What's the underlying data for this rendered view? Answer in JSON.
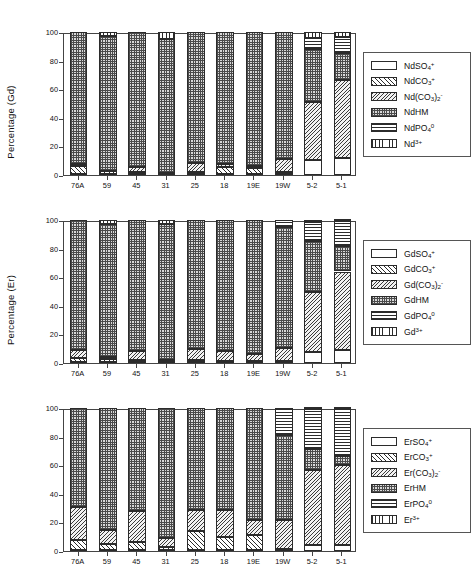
{
  "figure": {
    "panels": [
      {
        "id": "nd",
        "ylabel": "Percentage (Nd)",
        "legend_title": "Nd species",
        "legend": [
          {
            "key": "SO4",
            "label_html": "NdSO<sub>4</sub><sup>+</sup>",
            "pattern": "p-so4"
          },
          {
            "key": "CO3",
            "label_html": "NdCO<sub>3</sub><sup>+</sup>",
            "pattern": "p-co3"
          },
          {
            "key": "CO32",
            "label_html": "Nd(CO<sub>3</sub>)<sub>2</sub><sup>-</sup>",
            "pattern": "p-co32"
          },
          {
            "key": "HM",
            "label_html": "NdHM",
            "pattern": "p-hm"
          },
          {
            "key": "PO4",
            "label_html": "NdPO<sub>4</sub><sup>0</sup>",
            "pattern": "p-po4"
          },
          {
            "key": "FREE",
            "label_html": "Nd<sup>3+</sup>",
            "pattern": "p-free"
          }
        ]
      },
      {
        "id": "gd",
        "ylabel": "Percentage (Gd)",
        "legend_title": "Gd species",
        "legend": [
          {
            "key": "SO4",
            "label_html": "GdSO<sub>4</sub><sup>+</sup>",
            "pattern": "p-so4"
          },
          {
            "key": "CO3",
            "label_html": "GdCO<sub>3</sub><sup>+</sup>",
            "pattern": "p-co3"
          },
          {
            "key": "CO32",
            "label_html": "Gd(CO<sub>3</sub>)<sub>2</sub><sup>-</sup>",
            "pattern": "p-co32"
          },
          {
            "key": "HM",
            "label_html": "GdHM",
            "pattern": "p-hm"
          },
          {
            "key": "PO4",
            "label_html": "GdPO<sub>4</sub><sup>0</sup>",
            "pattern": "p-po4"
          },
          {
            "key": "FREE",
            "label_html": "Gd<sup>3+</sup>",
            "pattern": "p-free"
          }
        ]
      },
      {
        "id": "er",
        "ylabel": "Percentage (Er)",
        "legend_title": "Er species",
        "legend": [
          {
            "key": "SO4",
            "label_html": "ErSO<sub>4</sub><sup>+</sup>",
            "pattern": "p-so4"
          },
          {
            "key": "CO3",
            "label_html": "ErCO<sub>3</sub><sup>+</sup>",
            "pattern": "p-co3"
          },
          {
            "key": "CO32",
            "label_html": "Er(CO<sub>3</sub>)<sub>2</sub><sup>-</sup>",
            "pattern": "p-co32"
          },
          {
            "key": "HM",
            "label_html": "ErHM",
            "pattern": "p-hm"
          },
          {
            "key": "PO4",
            "label_html": "ErPO<sub>4</sub><sup>0</sup>",
            "pattern": "p-po4"
          },
          {
            "key": "FREE",
            "label_html": "Er<sup>3+</sup>",
            "pattern": "p-free"
          }
        ]
      }
    ]
  },
  "chart_data": [
    {
      "type": "bar",
      "stacked": true,
      "title": "",
      "xlabel": "",
      "ylabel": "Percentage (Nd)",
      "ylim": [
        0,
        100
      ],
      "yticks": [
        0,
        20,
        40,
        60,
        80,
        100
      ],
      "grid": false,
      "legend_position": "right-outside",
      "categories": [
        "76A",
        "59",
        "45",
        "31",
        "25",
        "18",
        "19E",
        "19W",
        "5-2",
        "5-1"
      ],
      "series": [
        {
          "name": "NdSO4+",
          "pattern": "p-so4",
          "values": [
            0.6,
            0.5,
            0.5,
            0.4,
            0.6,
            0.5,
            0.5,
            0.8,
            10.3,
            12.0
          ]
        },
        {
          "name": "NdCO3+",
          "pattern": "p-co3",
          "values": [
            5.6,
            2.3,
            1.9,
            0.8,
            1.7,
            5.0,
            4.6,
            1.0,
            0.0,
            0.0
          ]
        },
        {
          "name": "Nd(CO3)2-",
          "pattern": "p-co32",
          "values": [
            1.3,
            0.0,
            3.4,
            0.0,
            5.8,
            2.2,
            1.5,
            9.2,
            41.0,
            54.5
          ]
        },
        {
          "name": "NdHM",
          "pattern": "p-hm",
          "values": [
            92.5,
            94.2,
            94.2,
            94.0,
            91.9,
            92.3,
            93.4,
            89.0,
            37.0,
            19.0
          ]
        },
        {
          "name": "NdPO4-0",
          "pattern": "p-po4",
          "values": [
            0.0,
            0.0,
            0.0,
            0.0,
            0.0,
            0.0,
            0.0,
            0.0,
            7.2,
            11.0
          ]
        },
        {
          "name": "Nd3+",
          "pattern": "p-free",
          "values": [
            0.0,
            3.0,
            0.0,
            4.8,
            0.0,
            0.0,
            0.0,
            0.0,
            4.5,
            3.5
          ]
        }
      ]
    },
    {
      "type": "bar",
      "stacked": true,
      "title": "",
      "xlabel": "",
      "ylabel": "Percentage (Gd)",
      "ylim": [
        0,
        100
      ],
      "yticks": [
        0,
        20,
        40,
        60,
        80,
        100
      ],
      "grid": false,
      "legend_position": "right-outside",
      "categories": [
        "76A",
        "59",
        "45",
        "31",
        "25",
        "18",
        "19E",
        "19W",
        "5-2",
        "5-1"
      ],
      "series": [
        {
          "name": "GdSO4+",
          "pattern": "p-so4",
          "values": [
            0.5,
            0.5,
            0.4,
            0.4,
            0.5,
            0.4,
            0.4,
            0.6,
            8.0,
            9.0
          ]
        },
        {
          "name": "GdCO3+",
          "pattern": "p-co3",
          "values": [
            3.0,
            2.2,
            2.0,
            1.0,
            1.5,
            1.2,
            1.0,
            1.0,
            0.0,
            0.0
          ]
        },
        {
          "name": "Gd(CO3)2-",
          "pattern": "p-co32",
          "values": [
            5.5,
            1.8,
            6.0,
            1.0,
            7.5,
            7.0,
            4.8,
            9.0,
            41.5,
            55.0
          ]
        },
        {
          "name": "GdHM",
          "pattern": "p-hm",
          "values": [
            91.0,
            93.0,
            91.6,
            94.6,
            90.5,
            91.4,
            93.8,
            84.4,
            36.0,
            17.5
          ]
        },
        {
          "name": "GdPO4-0",
          "pattern": "p-po4",
          "values": [
            0.0,
            0.0,
            0.0,
            0.0,
            0.0,
            0.0,
            0.0,
            5.0,
            13.0,
            17.5
          ]
        },
        {
          "name": "Gd3+",
          "pattern": "p-free",
          "values": [
            0.0,
            2.5,
            0.0,
            3.0,
            0.0,
            0.0,
            0.0,
            0.0,
            1.5,
            1.0
          ]
        }
      ]
    },
    {
      "type": "bar",
      "stacked": true,
      "title": "",
      "xlabel": "",
      "ylabel": "Percentage (Er)",
      "ylim": [
        0,
        100
      ],
      "yticks": [
        0,
        20,
        40,
        60,
        80,
        100
      ],
      "grid": false,
      "legend_position": "right-outside",
      "categories": [
        "76A",
        "59",
        "45",
        "31",
        "25",
        "18",
        "19E",
        "19W",
        "5-2",
        "5-1"
      ],
      "series": [
        {
          "name": "ErSO4+",
          "pattern": "p-so4",
          "values": [
            0.5,
            0.4,
            0.4,
            0.4,
            0.5,
            0.4,
            0.4,
            0.5,
            4.0,
            4.0
          ]
        },
        {
          "name": "ErCO3+",
          "pattern": "p-co3",
          "values": [
            7.0,
            4.5,
            6.0,
            2.6,
            13.5,
            9.5,
            10.5,
            1.0,
            0.0,
            0.0
          ]
        },
        {
          "name": "Er(CO3)2-",
          "pattern": "p-co32",
          "values": [
            23.0,
            10.0,
            21.5,
            6.0,
            14.5,
            19.0,
            10.5,
            20.5,
            52.5,
            56.5
          ]
        },
        {
          "name": "ErHM",
          "pattern": "p-hm",
          "values": [
            69.5,
            85.1,
            72.1,
            91.0,
            71.5,
            71.1,
            78.6,
            59.0,
            14.5,
            6.0
          ]
        },
        {
          "name": "ErPO4-0",
          "pattern": "p-po4",
          "values": [
            0.0,
            0.0,
            0.0,
            0.0,
            0.0,
            0.0,
            0.0,
            19.0,
            28.0,
            32.5
          ]
        },
        {
          "name": "Er3+",
          "pattern": "p-free",
          "values": [
            0.0,
            0.0,
            0.0,
            0.0,
            0.0,
            0.0,
            0.0,
            0.0,
            1.0,
            1.0
          ]
        }
      ]
    }
  ]
}
